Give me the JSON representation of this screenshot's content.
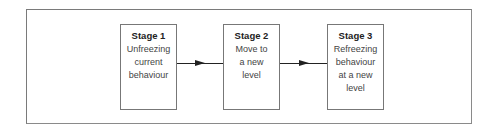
{
  "diagram": {
    "type": "flow",
    "direction": "left-to-right",
    "stages": [
      {
        "title": "Stage 1",
        "description_lines": [
          "Unfreezing",
          "current",
          "behaviour"
        ]
      },
      {
        "title": "Stage 2",
        "description_lines": [
          "Move to",
          "a new",
          "level"
        ]
      },
      {
        "title": "Stage 3",
        "description_lines": [
          "Refreezing",
          "behaviour",
          "at a new",
          "level"
        ]
      }
    ],
    "connections": [
      {
        "from": "Stage 1",
        "to": "Stage 2"
      },
      {
        "from": "Stage 2",
        "to": "Stage 3"
      }
    ],
    "colors": {
      "border": "#777777",
      "arrow": "#222222",
      "background": "#ffffff"
    }
  }
}
